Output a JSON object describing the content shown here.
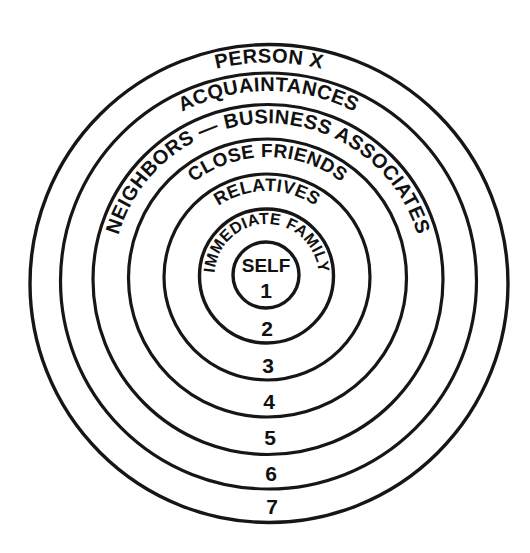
{
  "diagram": {
    "background_color": "#ffffff",
    "stroke_color": "#161616",
    "text_color": "#111111",
    "center": {
      "x": 266,
      "y": 275
    },
    "center_label": "SELF",
    "center_number": "1",
    "rings": [
      {
        "index": 1,
        "number": "1",
        "label": "SELF",
        "radius": 33,
        "stroke_width": 3.4,
        "label_style": "center"
      },
      {
        "index": 2,
        "number": "2",
        "label": "IMMEDIATE FAMILY",
        "radius": 67,
        "stroke_width": 3.4,
        "label_style": "arc",
        "label_font_size": 16,
        "label_radius": 52,
        "label_sweep": 218
      },
      {
        "index": 3,
        "number": "3",
        "label": "RELATIVES",
        "radius": 103,
        "stroke_width": 3.2,
        "label_style": "arc",
        "label_font_size": 18,
        "label_radius": 86,
        "label_sweep": 110
      },
      {
        "index": 4,
        "number": "4",
        "label": "CLOSE FRIENDS",
        "radius": 139,
        "stroke_width": 3.2,
        "label_style": "arc",
        "label_font_size": 19,
        "label_radius": 121,
        "label_sweep": 126
      },
      {
        "index": 5,
        "number": "5",
        "label": "NEIGHBORS — BUSINESS ASSOCIATES",
        "radius": 175,
        "stroke_width": 3.2,
        "label_style": "arc",
        "label_font_size": 20,
        "label_radius": 156,
        "label_sweep": 184
      },
      {
        "index": 6,
        "number": "6",
        "label": "ACQUAINTANCES",
        "radius": 208,
        "stroke_width": 3.2,
        "label_style": "arc",
        "label_font_size": 20,
        "label_radius": 190,
        "label_sweep": 110
      },
      {
        "index": 7,
        "number": "7",
        "label": "PERSON X",
        "radius": 239,
        "stroke_width": 3.4,
        "label_style": "arc",
        "label_font_size": 20,
        "label_radius": 221,
        "label_sweep": 66
      }
    ],
    "number_column": [
      {
        "value": "1",
        "x": 266,
        "y": 298,
        "font_size": 21
      },
      {
        "value": "2",
        "x": 267,
        "y": 336,
        "font_size": 21
      },
      {
        "value": "3",
        "x": 268,
        "y": 373,
        "font_size": 21
      },
      {
        "value": "4",
        "x": 269,
        "y": 409,
        "font_size": 21
      },
      {
        "value": "5",
        "x": 270,
        "y": 445,
        "font_size": 21
      },
      {
        "value": "6",
        "x": 271,
        "y": 481,
        "font_size": 21
      },
      {
        "value": "7",
        "x": 272,
        "y": 514,
        "font_size": 21
      }
    ],
    "center_text": {
      "self_x": 266,
      "self_y": 272,
      "self_font_size": 19
    }
  }
}
